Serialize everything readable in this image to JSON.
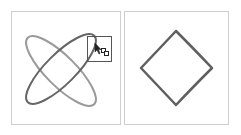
{
  "figure": {
    "panels": [
      {
        "name": "before",
        "shapes": [
          {
            "type": "ellipse",
            "cx": 61,
            "cy": 69,
            "rx": 46,
            "ry": 16,
            "rotate": 45,
            "stroke": "#9a9a9a"
          },
          {
            "type": "ellipse",
            "cx": 61,
            "cy": 69,
            "rx": 46,
            "ry": 16,
            "rotate": -45,
            "stroke": "#666666"
          }
        ],
        "selection_box": {
          "x": 87,
          "y": 36,
          "w": 24,
          "h": 25,
          "stroke": "#555555"
        },
        "cursor": "shape-builder-cursor"
      },
      {
        "name": "after",
        "shapes": [
          {
            "type": "diamond",
            "points": "176,31 212,68 176,105 141,68",
            "stroke": "#5f5f5f"
          }
        ]
      }
    ],
    "colors": {
      "panel_border": "#cfcfcf",
      "dark_stroke": "#666666",
      "light_stroke": "#9a9a9a"
    }
  }
}
